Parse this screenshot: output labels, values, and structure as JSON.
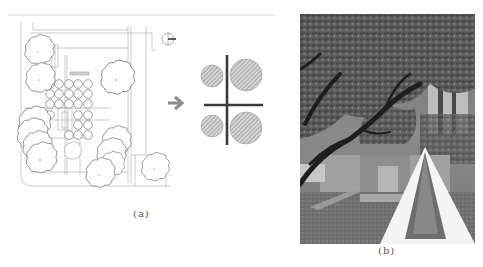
{
  "figure": {
    "panels": [
      {
        "id": "a",
        "caption": "(a)",
        "content": "Site plan drawing with tree canopies, grid of 5x6 circular plantings, north arrow, and arrow pointing to abstract diagram",
        "diagram": {
          "description": "Cross axis with four hatched circles (two small left, two large right)",
          "arrow_symbol": "➔",
          "circles": [
            {
              "position": "top-left",
              "size": "small"
            },
            {
              "position": "top-right",
              "size": "large"
            },
            {
              "position": "bottom-left",
              "size": "small"
            },
            {
              "position": "bottom-right",
              "size": "large"
            }
          ]
        },
        "north_arrow": "north-arrow"
      },
      {
        "id": "b",
        "caption": "(b)",
        "content": "Grayscale photograph of a garden with large oak tree, concrete walls, lawn, and a long narrow water channel"
      }
    ],
    "colors": {
      "line": "#9a9a9a",
      "dark_line": "#3a3a3a",
      "hatch": "#8a8a8a",
      "arrow": "#8c8c8c"
    }
  }
}
